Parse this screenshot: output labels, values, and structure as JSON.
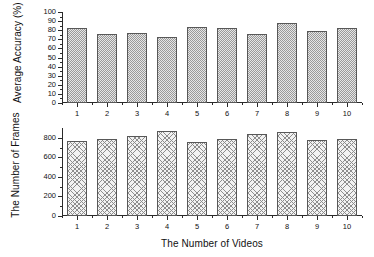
{
  "figure": {
    "title": "",
    "xlabel": "The Number of Videos"
  },
  "chart_data": [
    {
      "id": "accuracy_panel",
      "type": "bar",
      "title": "",
      "xlabel": "",
      "ylabel": "Average Accuracy (%)",
      "categories": [
        "1",
        "2",
        "3",
        "4",
        "5",
        "6",
        "7",
        "8",
        "9",
        "10"
      ],
      "values": [
        82,
        76,
        77.5,
        73,
        84,
        83,
        75.5,
        87.5,
        79.5,
        82.5
      ],
      "ylim": [
        0,
        100
      ],
      "yticks": [
        0,
        10,
        20,
        30,
        40,
        50,
        60,
        70,
        80,
        90,
        100
      ],
      "ytick_labels": [
        "0",
        "10",
        "20",
        "30",
        "40",
        "50",
        "60",
        "70",
        "80",
        "90",
        "100"
      ],
      "xtick_labels": [
        "1",
        "2",
        "3",
        "4",
        "5",
        "6",
        "7",
        "8",
        "9",
        "10"
      ],
      "grid": false,
      "legend": false,
      "bar_fill": "stipple",
      "bar_face_color": "#e6e6e6",
      "bar_edge_color": "#585858"
    },
    {
      "id": "frames_panel",
      "type": "bar",
      "title": "",
      "xlabel": "The Number of Videos",
      "ylabel": "The Number of Frames",
      "categories": [
        "1",
        "2",
        "3",
        "4",
        "5",
        "6",
        "7",
        "8",
        "9",
        "10"
      ],
      "values": [
        770,
        788,
        818,
        872,
        762,
        784,
        838,
        862,
        778,
        792
      ],
      "ylim": [
        0,
        900
      ],
      "yticks": [
        0,
        200,
        400,
        600,
        800
      ],
      "ytick_labels": [
        "0",
        "200",
        "400",
        "600",
        "800"
      ],
      "xtick_labels": [
        "1",
        "2",
        "3",
        "4",
        "5",
        "6",
        "7",
        "8",
        "9",
        "10"
      ],
      "grid": false,
      "legend": false,
      "bar_fill": "crosshatch",
      "bar_face_color": "#f2f2f2",
      "bar_edge_color": "#8d8d8d"
    }
  ],
  "colors": {
    "axis": "#2a2a2a",
    "text": "#111111",
    "background": "#ffffff"
  }
}
